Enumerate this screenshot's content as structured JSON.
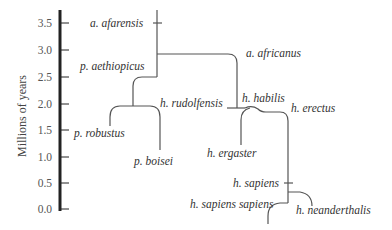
{
  "axis": {
    "label": "Millions of years",
    "ticks": [
      {
        "label": "3.5",
        "y": 23
      },
      {
        "label": "3.0",
        "y": 50
      },
      {
        "label": "2.5",
        "y": 77
      },
      {
        "label": "2.0",
        "y": 104
      },
      {
        "label": "1.5",
        "y": 130
      },
      {
        "label": "1.0",
        "y": 157
      },
      {
        "label": "0.5",
        "y": 183
      },
      {
        "label": "0.0",
        "y": 209
      }
    ]
  },
  "species": {
    "a_afarensis": "a. afarensis",
    "p_aethiopicus": "p. aethiopicus",
    "a_africanus": "a. africanus",
    "h_rudolfensis": "h. rudolfensis",
    "h_habilis": "h. habilis",
    "h_erectus": "h. erectus",
    "p_robustus": "p. robustus",
    "p_boisei": "p. boisei",
    "h_ergaster": "h. ergaster",
    "h_sapiens": "h. sapiens",
    "h_sapiens_sapiens": "h. sapiens sapiens",
    "h_neanderthalis": "h. neanderthalis"
  },
  "colors": {
    "axis": "#222222",
    "branch": "#555555",
    "text": "#333333"
  }
}
